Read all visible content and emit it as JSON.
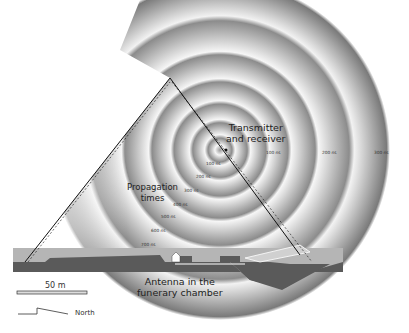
{
  "diagram": {
    "labels": {
      "transmitter": [
        "Transmitter",
        "and receiver"
      ],
      "propagation": [
        "Propagation",
        "times"
      ],
      "antenna": [
        "Antenna in the",
        "funerary chamber"
      ]
    },
    "inside_times": [
      "100 ns",
      "200 ns",
      "300 ns",
      "400 ns",
      "500 ns",
      "600 ns",
      "700 ns"
    ],
    "outside_times": [
      "100 ns",
      "200 ns",
      "300 ns"
    ],
    "scale_bar": "50 m",
    "north_label": "North",
    "colors": {
      "ring_dark": "#8a8a8a",
      "ring_light": "#f2f2f2",
      "ground_dark": "#5a5a5a",
      "ground_light": "#b5b5b5",
      "line": "#111111"
    }
  }
}
